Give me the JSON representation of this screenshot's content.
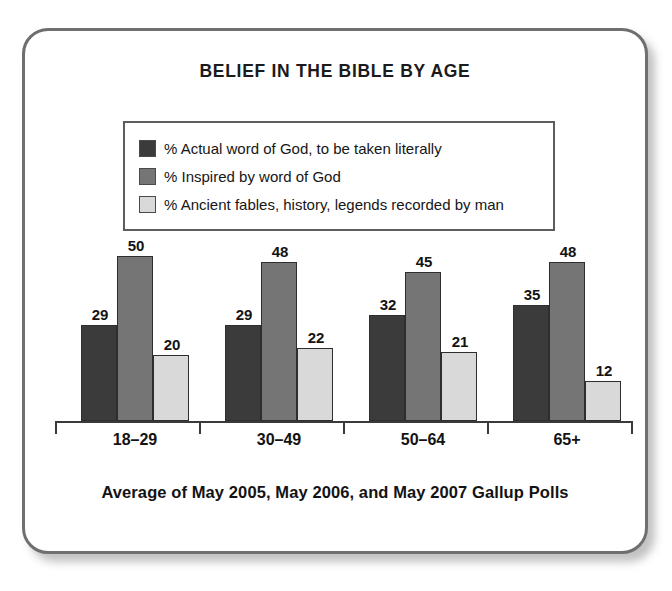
{
  "chart_data": {
    "type": "bar",
    "title": "BELIEF IN THE BIBLE BY AGE",
    "footer": "Average of May 2005, May 2006, and May 2007 Gallup Polls",
    "xlabel": "",
    "ylabel": "",
    "ylim": [
      0,
      55
    ],
    "grid": false,
    "legend_position": "top-center",
    "categories": [
      "18–29",
      "30–49",
      "50–64",
      "65+"
    ],
    "series": [
      {
        "name": "% Actual word of God, to be taken literally",
        "color": "#3b3b3b",
        "values": [
          29,
          29,
          32,
          35
        ]
      },
      {
        "name": "% Inspired by word of God",
        "color": "#757575",
        "values": [
          50,
          48,
          45,
          48
        ]
      },
      {
        "name": "% Ancient fables, history, legends recorded by man",
        "color": "#d9d9d9",
        "values": [
          20,
          22,
          21,
          12
        ]
      }
    ]
  },
  "chart": {
    "title": "BELIEF IN THE BIBLE BY AGE",
    "footer": "Average of May 2005, May 2006, and May 2007 Gallup Polls"
  },
  "legend": {
    "items": [
      {
        "label": "% Actual word of God, to be taken literally",
        "color": "#3b3b3b"
      },
      {
        "label": "% Inspired by word of God",
        "color": "#757575"
      },
      {
        "label": "% Ancient fables, history, legends recorded by man",
        "color": "#d9d9d9"
      }
    ]
  },
  "axis": {
    "categories": [
      "18–29",
      "30–49",
      "50–64",
      "65+"
    ]
  },
  "values": {
    "g0": {
      "s0": "29",
      "s1": "50",
      "s2": "20"
    },
    "g1": {
      "s0": "29",
      "s1": "48",
      "s2": "22"
    },
    "g2": {
      "s0": "32",
      "s1": "45",
      "s2": "21"
    },
    "g3": {
      "s0": "35",
      "s1": "48",
      "s2": "12"
    }
  }
}
